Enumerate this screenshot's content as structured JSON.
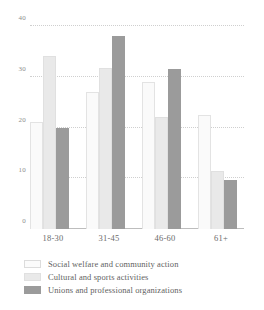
{
  "chart_data": {
    "type": "bar",
    "title": "",
    "subtitle": "",
    "xlabel": "",
    "ylabel": "",
    "categories": [
      "18-30",
      "31-45",
      "46-60",
      "61+"
    ],
    "series": [
      {
        "name": "Social welfare and community action",
        "color": "#fafafa",
        "values": [
          21,
          27,
          29,
          22.5
        ]
      },
      {
        "name": "Cultural and sports activities",
        "color": "#e9e9e9",
        "values": [
          34,
          31.8,
          22,
          11.5
        ]
      },
      {
        "name": "Unions and professional organizations",
        "color": "#9b9b9b",
        "values": [
          20,
          38,
          31.5,
          9.7
        ]
      }
    ],
    "ylim": [
      0,
      40
    ],
    "yticks": [
      0,
      10,
      20,
      30,
      40
    ],
    "ytick_labels": [
      "0",
      "10",
      "20",
      "30",
      "40"
    ],
    "grid": true,
    "grid_style": "dotted",
    "legend_position": "bottom-left",
    "bar_group_order": [
      "Social welfare and community action",
      "Cultural and sports activities",
      "Unions and professional organizations"
    ]
  }
}
